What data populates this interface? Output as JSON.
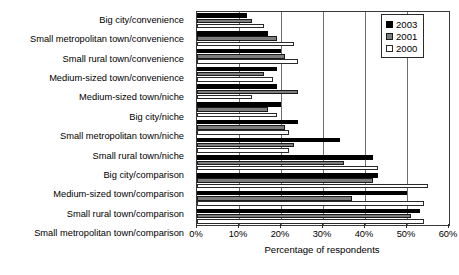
{
  "chart_data": {
    "type": "bar",
    "orientation": "horizontal",
    "title": "",
    "xlabel": "Percentage of respondents",
    "ylabel": "",
    "xlim": [
      0,
      60
    ],
    "xunit": "%",
    "xticks": [
      0,
      10,
      20,
      30,
      40,
      50,
      60
    ],
    "xtick_labels": [
      "0%",
      "10%",
      "20%",
      "30%",
      "40%",
      "50%",
      "60%"
    ],
    "grid": "vertical",
    "legend_position": "top-right",
    "categories": [
      "Big city/convenience",
      "Small metropolitan town/convenience",
      "Small rural town/convenience",
      "Medium-sized town/convenience",
      "Medium-sized town/niche",
      "Big city/niche",
      "Small metropolitan town/niche",
      "Small rural town/niche",
      "Big city/comparison",
      "Medium-sized town/comparison",
      "Small rural town/comparison",
      "Small metropolitan town/comparison"
    ],
    "series": [
      {
        "name": "2003",
        "color": "#000000",
        "values": [
          12,
          17,
          20,
          19,
          19,
          20,
          24,
          34,
          42,
          43,
          50,
          53
        ]
      },
      {
        "name": "2001",
        "color": "#7d7d7d",
        "values": [
          13,
          19,
          21,
          16,
          24,
          17,
          21,
          23,
          35,
          42,
          37,
          51
        ]
      },
      {
        "name": "2000",
        "color": "#ffffff",
        "values": [
          16,
          23,
          24,
          18,
          13,
          19,
          22,
          22,
          43,
          55,
          54,
          54
        ]
      }
    ]
  },
  "legend": {
    "entries": [
      {
        "label": "2003",
        "swatch": "swatch-black"
      },
      {
        "label": "2001",
        "swatch": "swatch-gray"
      },
      {
        "label": "2000",
        "swatch": "swatch-white"
      }
    ]
  }
}
